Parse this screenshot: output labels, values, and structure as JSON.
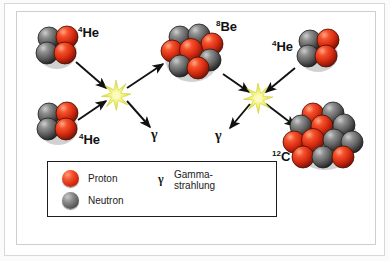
{
  "diagram": {
    "colors": {
      "proton": "#e8391a",
      "neutron": "#6a6a6a",
      "burst": "#e8e83c",
      "arrow": "#111111",
      "frame": "#cfcfcf",
      "legend_border": "#1d1d1d"
    },
    "nuclei": [
      {
        "id": "he4-top-left",
        "label_mass": "4",
        "label_symbol": "He",
        "label_text": "4He",
        "protons": 2,
        "neutrons": 2,
        "nucleon_count": 4
      },
      {
        "id": "he4-bottom-left",
        "label_mass": "4",
        "label_symbol": "He",
        "label_text": "4He",
        "protons": 2,
        "neutrons": 2,
        "nucleon_count": 4
      },
      {
        "id": "be8-center",
        "label_mass": "8",
        "label_symbol": "Be",
        "label_text": "8Be",
        "protons": 4,
        "neutrons": 4,
        "nucleon_count": 8
      },
      {
        "id": "he4-top-right",
        "label_mass": "4",
        "label_symbol": "He",
        "label_text": "4He",
        "protons": 2,
        "neutrons": 2,
        "nucleon_count": 4
      },
      {
        "id": "c12-bottom-right",
        "label_mass": "12",
        "label_symbol": "C",
        "label_text": "12C",
        "protons": 6,
        "neutrons": 6,
        "nucleon_count": 12
      }
    ],
    "gamma_emissions": [
      {
        "id": "gamma-left",
        "symbol": "γ"
      },
      {
        "id": "gamma-right",
        "symbol": "γ"
      }
    ],
    "reaction_points": [
      {
        "id": "burst-left"
      },
      {
        "id": "burst-right"
      }
    ]
  },
  "legend": {
    "items": [
      {
        "key": "proton",
        "label": "Proton",
        "color": "#e8391a"
      },
      {
        "key": "neutron",
        "label": "Neutron",
        "color": "#6a6a6a"
      }
    ],
    "gamma": {
      "symbol": "γ",
      "line1": "Gamma-",
      "line2": "strahlung"
    }
  }
}
